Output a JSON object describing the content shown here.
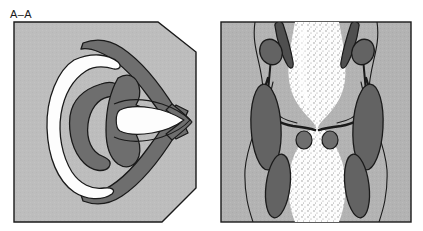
{
  "figure": {
    "background_color": "#ffffff",
    "width": 423,
    "height": 231
  },
  "palette": {
    "background": "#ffffff",
    "tissue_light_gray": "#bdbdbd",
    "tissue_mid_gray": "#b3b3b3",
    "organ_dark_gray": "#6e6e6e",
    "organ_darker_gray": "#636363",
    "lumen_white": "#fdfdfd",
    "stipple_dot": "#8a8a8a",
    "outline_black": "#1a1a1a",
    "label_text": "#1a1a1a"
  },
  "panels": [
    {
      "id": "panel-a",
      "label": "A–A",
      "label_name": "section-label-a-a",
      "description": "Chamfered-corner panel; light gray tissue field containing a V-shaped dark structure opening to the left, a white crescent band, a C-shaped dark mass and a central white wedge tapering to the right apex.",
      "outline_shape": "hexagon-chamfered-right",
      "fill": "#bdbdbd",
      "features": [
        {
          "name": "v-shaped-dark-band",
          "fill": "#6e6e6e",
          "note": "Large V / chevron opening leftward, apex at right"
        },
        {
          "name": "white-crescent-band",
          "fill": "#fdfdfd",
          "note": "Irregular crescent on the left side"
        },
        {
          "name": "c-shaped-dark-mass",
          "fill": "#6e6e6e",
          "note": "Inner C opening rightward"
        },
        {
          "name": "central-white-wedge",
          "fill": "#fdfdfd",
          "note": "Elongated lens/wedge tapering to the right apex"
        },
        {
          "name": "inner-dark-core",
          "fill": "#6e6e6e",
          "note": "Dark body surrounding the central wedge"
        }
      ]
    },
    {
      "id": "panel-b",
      "label": "B–B",
      "label_name": "section-label-b-b",
      "description": "Rectangular panel; light gray tissue field with a vertical stippled white channel narrowing at mid-height, flanked by paired elongated dark ovals with small stalked nodules, and a pair of curved horn-like structures with two small round bodies at the waist.",
      "outline_shape": "rectangle",
      "fill": "#b3b3b3",
      "features": [
        {
          "name": "central-stippled-channel",
          "fill": "#fdfdfd",
          "note": "Hourglass-shaped stippled lumen, waisted at mid-height"
        },
        {
          "name": "left-elongated-dark-oval",
          "fill": "#636363"
        },
        {
          "name": "right-elongated-dark-oval",
          "fill": "#636363"
        },
        {
          "name": "left-stalked-nodule",
          "fill": "#636363",
          "note": "Small oval on thin stalk above the left oval"
        },
        {
          "name": "right-stalked-nodule",
          "fill": "#636363",
          "note": "Small oval on thin stalk above the right oval"
        },
        {
          "name": "left-lower-dark-oval",
          "fill": "#636363"
        },
        {
          "name": "right-lower-dark-oval",
          "fill": "#636363"
        },
        {
          "name": "curved-horn-left",
          "outline": "#1a1a1a",
          "note": "Hook/horn curving outward at mid-height"
        },
        {
          "name": "curved-horn-right",
          "outline": "#1a1a1a"
        },
        {
          "name": "small-round-body-left",
          "fill": "#6e6e6e"
        },
        {
          "name": "small-round-body-right",
          "fill": "#6e6e6e"
        },
        {
          "name": "upper-dark-strut-left",
          "fill": "#4f4f4f"
        },
        {
          "name": "upper-dark-strut-right",
          "fill": "#4f4f4f"
        },
        {
          "name": "contour-line-left",
          "outline": "#1a1a1a",
          "note": "Wavy vertical tissue boundary"
        },
        {
          "name": "contour-line-right",
          "outline": "#1a1a1a"
        }
      ]
    }
  ]
}
